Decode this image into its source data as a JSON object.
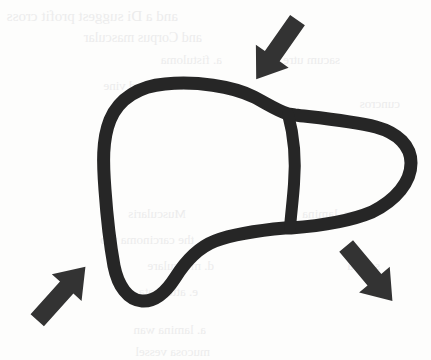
{
  "figure": {
    "title": "Liver outline diagram with three converging arrows",
    "subject": "liver",
    "style": "hand-drawn scanned line art",
    "canvas": {
      "width": 431,
      "height": 360
    },
    "colors": {
      "paper": "#fdfdfc",
      "ink": "#262626",
      "arrow": "#333333",
      "bleedthrough": "#ececec"
    },
    "outline": {
      "name": "liver-outline",
      "stroke_width": 13,
      "description": "Closed irregular organ silhouette: broad rounded left lobe, a tapering tongue-shaped right lobe extending to the right, and a notch along the inferior border."
    },
    "divider": {
      "name": "lobe-divider",
      "stroke_width": 12,
      "description": "Near-vertical internal line separating the left lobe from the right lobe"
    },
    "arrows": [
      {
        "name": "arrow-top-right",
        "label": "top-right arrow",
        "direction": "down-left",
        "angle_deg": 215,
        "position": {
          "x": 278,
          "y": 48
        }
      },
      {
        "name": "arrow-bottom-left",
        "label": "bottom-left arrow",
        "direction": "up-right",
        "angle_deg": 42,
        "position": {
          "x": 60,
          "y": 295
        }
      },
      {
        "name": "arrow-bottom-right",
        "label": "bottom-right arrow",
        "direction": "up-left",
        "angle_deg": 140,
        "position": {
          "x": 368,
          "y": 272
        }
      }
    ],
    "bleedthrough_lines": [
      {
        "text": "and a Di suggest profit cross",
        "x": 28,
        "y": 8,
        "size": 15
      },
      {
        "text": "and Corpus     mascular",
        "x": 52,
        "y": 30,
        "size": 14
      },
      {
        "text": "a. fistuloma",
        "x": 72,
        "y": 52,
        "size": 13
      },
      {
        "text": "sacum  utre",
        "x": 190,
        "y": 52,
        "size": 13
      },
      {
        "text": "b. rasse and vine",
        "x": 40,
        "y": 78,
        "size": 13
      },
      {
        "text": "cuncros",
        "x": 250,
        "y": 96,
        "size": 13
      },
      {
        "text": "Muscularis",
        "x": 36,
        "y": 206,
        "size": 13
      },
      {
        "text": "c. lamina",
        "x": 200,
        "y": 206,
        "size": 13
      },
      {
        "text": "the carcinoma  pro",
        "x": 44,
        "y": 232,
        "size": 13
      },
      {
        "text": "d. musculare",
        "x": 64,
        "y": 258,
        "size": 13
      },
      {
        "text": "serosa",
        "x": 230,
        "y": 258,
        "size": 13
      },
      {
        "text": "e. attenuata",
        "x": 48,
        "y": 284,
        "size": 13
      },
      {
        "text": "a. lamina wan",
        "x": 56,
        "y": 322,
        "size": 13
      },
      {
        "text": "mucosa vessel",
        "x": 60,
        "y": 344,
        "size": 13
      }
    ]
  }
}
